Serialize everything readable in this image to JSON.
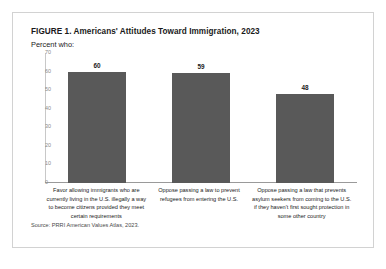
{
  "figure": {
    "title": "FIGURE 1. Americans' Attitudes Toward Immigration, 2023",
    "subtitle": "Percent who:",
    "source": "Source: PRRI American Values Atlas, 2023.",
    "frame_color": "#d2d2d2",
    "bar_color": "#595959",
    "axis_color": "#9a9a9a",
    "text_color": "#1a1a1a"
  },
  "chart_data": {
    "type": "bar",
    "title": "FIGURE 1. Americans' Attitudes Toward Immigration, 2023",
    "subtitle": "Percent who:",
    "xlabel": "",
    "ylabel": "",
    "ylim": [
      0,
      70
    ],
    "yticks": [
      70,
      60,
      50,
      40,
      30,
      20,
      10,
      0
    ],
    "grid": false,
    "legend": "none",
    "categories": [
      "Favor allowing immigrants who are currently living in the U.S. illegally a way to become citizens provided they meet certain requirements",
      "Oppose passing a law to prevent refugees from entering the U.S.",
      "Oppose passing a law that prevents asylum seekers from coming to the U.S. if they haven't first sought protection in some other country"
    ],
    "values": [
      60,
      59,
      48
    ],
    "value_labels": [
      "60",
      "59",
      "48"
    ],
    "source": "Source: PRRI American Values Atlas, 2023."
  }
}
